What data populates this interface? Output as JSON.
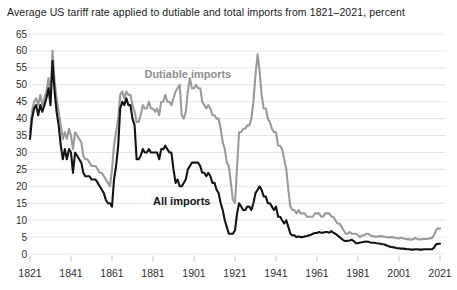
{
  "title": "Average US tariff rate applied to dutiable and total imports from 1821–2021, percent",
  "colors": {
    "dutiable_line": "#9b9b9b",
    "all_imports_line": "#141414",
    "grid": "#e6e6e6",
    "tick": "#c9c9c9",
    "axis_text": "#2e2e2e",
    "title_text": "#1c1c1c",
    "background": "#ffffff"
  },
  "chart_data": {
    "type": "line",
    "title": "Average US tariff rate applied to dutiable and total imports from 1821–2021, percent",
    "xlabel": "",
    "ylabel": "percent",
    "x_start_year": 1821,
    "x_end_year": 2021,
    "x_step": 1,
    "ylim": [
      0,
      65
    ],
    "yticks": [
      0,
      5,
      10,
      15,
      20,
      25,
      30,
      35,
      40,
      45,
      50,
      55,
      60,
      65
    ],
    "xticks": [
      1821,
      1841,
      1861,
      1881,
      1901,
      1921,
      1941,
      1961,
      1981,
      2001,
      2021
    ],
    "grid": "horizontal",
    "legend_position": "inline-annotations",
    "series": [
      {
        "name": "Dutiable imports",
        "color": "#9b9b9b",
        "values": [
          36,
          42,
          45,
          46,
          44,
          47,
          44,
          46,
          48,
          52,
          47,
          60,
          51,
          46,
          42,
          38,
          34,
          36,
          34,
          37,
          35,
          31,
          36,
          35,
          34,
          33,
          29,
          28,
          28,
          27,
          26,
          26,
          26,
          25,
          24,
          24,
          23,
          22,
          21,
          20,
          25,
          32,
          36,
          40,
          47,
          48,
          46,
          48,
          47,
          47,
          44,
          42,
          39,
          39,
          41,
          44,
          43,
          43,
          45,
          43,
          43,
          42,
          43,
          41,
          45,
          45,
          47,
          45,
          45,
          44,
          46,
          48,
          49,
          50,
          41,
          40,
          42,
          48,
          52,
          49,
          49,
          50,
          49,
          49,
          45,
          44,
          43,
          44,
          43,
          41,
          41,
          40,
          40,
          37,
          33,
          31,
          27,
          26,
          21,
          16,
          15,
          26,
          36,
          36,
          37,
          37,
          38,
          38,
          40,
          45,
          53,
          59,
          54,
          47,
          43,
          43,
          40,
          39,
          37,
          36,
          36,
          32,
          32,
          31,
          28,
          25,
          19,
          14,
          13,
          13,
          12,
          13,
          12,
          12,
          12,
          11,
          11,
          11,
          11,
          12,
          12,
          12,
          11,
          11,
          12,
          12,
          12,
          11,
          11,
          10,
          9,
          9,
          8,
          7,
          6,
          6,
          6.5,
          6,
          6,
          6,
          5.5,
          5,
          5.5,
          5.5,
          6,
          6,
          5.5,
          5.3,
          5.2,
          5.1,
          5.2,
          5.3,
          5.2,
          5.1,
          5,
          4.9,
          5,
          4.9,
          4.8,
          4.7,
          4.6,
          4.8,
          4.6,
          4.5,
          4.4,
          4.3,
          4.2,
          4.4,
          4.8,
          4.4,
          4.3,
          4.4,
          4.5,
          4.4,
          4.5,
          4.6,
          4.7,
          5.5,
          7,
          7.6,
          7.5
        ]
      },
      {
        "name": "All imports",
        "color": "#141414",
        "values": [
          34,
          40,
          43,
          44,
          41,
          44,
          42,
          44,
          46,
          49,
          44,
          57,
          48,
          42,
          38,
          32,
          28,
          31,
          28,
          31,
          30,
          24,
          30,
          29,
          28,
          27,
          24,
          23,
          23,
          23,
          22,
          22,
          22,
          21,
          20,
          19,
          18,
          16,
          15,
          15,
          14,
          22,
          26,
          32,
          43,
          45,
          44,
          46,
          44,
          44,
          40,
          38,
          28,
          28,
          29,
          31,
          30,
          30,
          31,
          30,
          30,
          30,
          30,
          28,
          31,
          31,
          32,
          31,
          30,
          30,
          25,
          21,
          22,
          20,
          20,
          21,
          22,
          25,
          26,
          27,
          27,
          27,
          27,
          26,
          24,
          24,
          23,
          24,
          23,
          21,
          21,
          19,
          18,
          15,
          13,
          10,
          8,
          6,
          6,
          6,
          7,
          12,
          15,
          14,
          13,
          13,
          14,
          14,
          13,
          15,
          18,
          19,
          20,
          19,
          17,
          17,
          15,
          15,
          14,
          13,
          14,
          11,
          11,
          10,
          9,
          10,
          8,
          6,
          5.5,
          5.5,
          5,
          5.2,
          5,
          5,
          5.2,
          5.3,
          5.5,
          5.7,
          6,
          6.2,
          6.2,
          6.5,
          6.3,
          6.3,
          6.5,
          6.5,
          6.3,
          6.8,
          6.3,
          6,
          5.5,
          5,
          4.5,
          4,
          3.8,
          3.9,
          4,
          4.2,
          3.8,
          3.2,
          3.2,
          3.4,
          3.5,
          3.6,
          3.7,
          3.6,
          3.4,
          3.3,
          3.3,
          3.2,
          3.1,
          3,
          2.9,
          2.8,
          2.5,
          2.3,
          2.1,
          2,
          1.9,
          1.7,
          1.7,
          1.6,
          1.6,
          1.5,
          1.4,
          1.4,
          1.3,
          1.3,
          1.4,
          1.4,
          1.3,
          1.3,
          1.4,
          1.4,
          1.4,
          1.4,
          1.4,
          1.8,
          2.8,
          3,
          3
        ]
      }
    ],
    "annotations": [
      {
        "text": "Dutiable imports",
        "x_year": 1898,
        "y_value": 52,
        "color": "#8f8f8f"
      },
      {
        "text": "All imports",
        "x_year": 1895,
        "y_value": 14.5,
        "color": "#141414"
      }
    ]
  }
}
